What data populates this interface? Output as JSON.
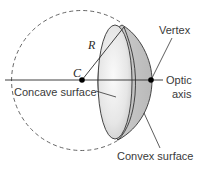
{
  "diagram": {
    "labels": {
      "radius": "R",
      "center": "C",
      "concave": "Concave surface",
      "vertex": "Vertex",
      "optic_line1": "Optic",
      "optic_line2": "axis",
      "convex": "Convex surface"
    },
    "colors": {
      "line": "#2b2b2b",
      "dashed_circle": "#555555",
      "lens_outer": "#c9c9c9",
      "lens_inner": "#ececec",
      "point": "#000000"
    }
  }
}
